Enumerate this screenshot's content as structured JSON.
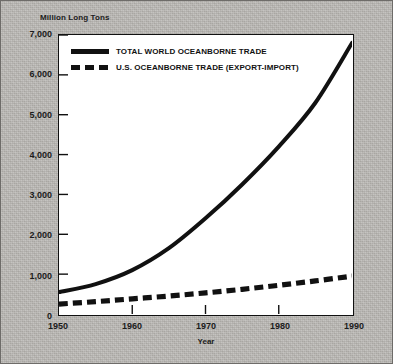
{
  "chart_data": {
    "type": "line",
    "title": "",
    "ylabel": "Million Long Tons",
    "xlabel": "Year",
    "xlim": [
      1950,
      1990
    ],
    "ylim": [
      0,
      7000
    ],
    "grid": false,
    "legend_position": "top-left inside plot",
    "x_ticks": [
      "1950",
      "1960",
      "1970",
      "1980",
      "1990"
    ],
    "y_ticks": [
      "0",
      "1,000",
      "2,000",
      "3,000",
      "4,000",
      "5,000",
      "6,000",
      "7,000"
    ],
    "x": [
      1950,
      1955,
      1960,
      1965,
      1970,
      1975,
      1980,
      1985,
      1990
    ],
    "series": [
      {
        "name": "TOTAL WORLD OCEANBORNE TRADE",
        "style": "solid",
        "color": "#111111",
        "values": [
          550,
          750,
          1100,
          1650,
          2400,
          3250,
          4200,
          5300,
          6800
        ]
      },
      {
        "name": "U.S. OCEANBORNE TRADE (EXPORT-IMPORT)",
        "style": "dashed",
        "color": "#111111",
        "values": [
          250,
          310,
          380,
          450,
          530,
          620,
          720,
          830,
          950
        ]
      }
    ]
  },
  "legend": {
    "items": [
      {
        "label": "TOTAL WORLD OCEANBORNE TRADE"
      },
      {
        "label": "U.S. OCEANBORNE TRADE (EXPORT-IMPORT)"
      }
    ]
  }
}
